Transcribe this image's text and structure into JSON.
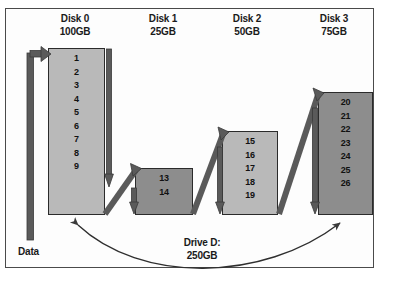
{
  "diagram": {
    "title_absent": true,
    "source_label": "Data",
    "volume": {
      "name": "Drive D:",
      "size": "250GB"
    },
    "disks": [
      {
        "name": "Disk 0",
        "size": "100GB",
        "fill": "light",
        "blocks": [
          "1",
          "2",
          "3",
          "4",
          "5",
          "6",
          "7",
          "8",
          "9"
        ]
      },
      {
        "name": "Disk 1",
        "size": "25GB",
        "fill": "dark",
        "blocks": [
          "13",
          "14"
        ]
      },
      {
        "name": "Disk 2",
        "size": "50GB",
        "fill": "light",
        "blocks": [
          "15",
          "16",
          "17",
          "18",
          "19"
        ]
      },
      {
        "name": "Disk 3",
        "size": "75GB",
        "fill": "dark",
        "blocks": [
          "20",
          "21",
          "22",
          "23",
          "24",
          "25",
          "26"
        ]
      }
    ],
    "colors": {
      "fill_light": "#b9b9b9",
      "fill_dark": "#8d8d8d",
      "outline": "#2b2b2b",
      "arrow": "#555555",
      "frame": "#4a4a4a",
      "text": "#111111"
    }
  }
}
